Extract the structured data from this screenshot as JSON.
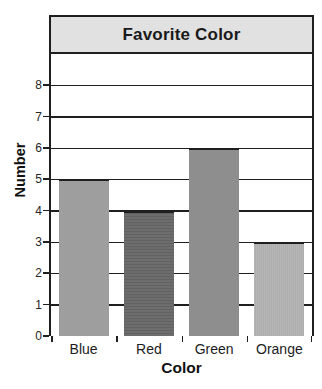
{
  "chart_data": {
    "type": "bar",
    "title": "Favorite Color",
    "xlabel": "Color",
    "ylabel": "Number",
    "categories": [
      "Blue",
      "Red",
      "Green",
      "Orange"
    ],
    "values": [
      5,
      4,
      6,
      3
    ],
    "bar_colors": [
      "#9e9e9e",
      "#6d6d6d",
      "#8e8e8e",
      "#aeaeae"
    ],
    "bar_textures": [
      "none",
      "h-stripes",
      "none",
      "dots"
    ],
    "ylim": [
      0,
      9
    ],
    "yticks": [
      0,
      1,
      2,
      3,
      4,
      5,
      6,
      7,
      8
    ],
    "grid": true,
    "legend": "none"
  },
  "colors": {
    "banner_background": "#e1e1e1",
    "plot_background": "#ffffff",
    "border": "#1f1f1f",
    "gridline": "#1f1f1f",
    "text": "#1a1a1a"
  }
}
